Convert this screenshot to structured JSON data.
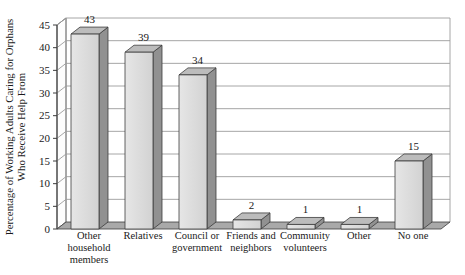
{
  "chart_data": {
    "type": "bar",
    "style": "3d-oblique-grayscale",
    "title": "",
    "ylabel_lines": [
      "Percentage of Working Adults Caring for Orphans",
      "Who Receive Help From"
    ],
    "xlabel": "",
    "categories": [
      "Other household members",
      "Relatives",
      "Council or government",
      "Friends and neighbors",
      "Community volunteers",
      "Other",
      "No one"
    ],
    "category_label_lines": [
      [
        "Other",
        "household",
        "members"
      ],
      [
        "Relatives"
      ],
      [
        "Council or",
        "government"
      ],
      [
        "Friends and",
        "neighbors"
      ],
      [
        "Community",
        "volunteers"
      ],
      [
        "Other"
      ],
      [
        "No one"
      ]
    ],
    "values": [
      43,
      39,
      34,
      2,
      1,
      1,
      15
    ],
    "value_labels": [
      "43",
      "39",
      "34",
      "2",
      "1",
      "1",
      "15"
    ],
    "ylim": [
      0,
      45
    ],
    "yticks": [
      0,
      5,
      10,
      15,
      20,
      25,
      30,
      35,
      40,
      45
    ],
    "ytick_labels": [
      "0",
      "5",
      "10",
      "15",
      "20",
      "25",
      "30",
      "35",
      "40",
      "45"
    ],
    "grid": "horizontal",
    "legend": "none",
    "colors": {
      "background": "#ffffff",
      "bar_front_light": "#e6e6e6",
      "bar_front": "#d2d2d2",
      "bar_top": "#bcbcbc",
      "bar_side": "#919191",
      "floor": "#a9a9a9",
      "wall": "#fdfdfd",
      "outline": "#3c3c3c",
      "gridline": "#9c9c9c",
      "text": "#1a1a1a"
    }
  }
}
